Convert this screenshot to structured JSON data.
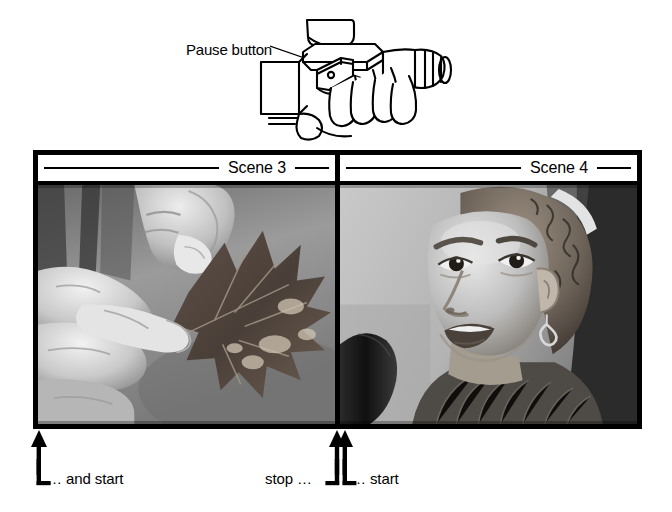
{
  "figure": {
    "illustration": {
      "callout_label": "Pause button",
      "subject_icon": "camcorder-in-hand-icon",
      "leader_line_icon": "leader-line-icon"
    },
    "scenes": [
      {
        "id": "scene-3",
        "title": "Scene 3",
        "photo_icon": "hands-holding-leaf-photo",
        "photo_description": "Black and white photo of two hands holding a dried maple leaf"
      },
      {
        "id": "scene-4",
        "title": "Scene 4",
        "photo_icon": "girl-speaking-into-microphone-photo",
        "photo_description": "Black and white photo of a young girl speaking into a microphone"
      }
    ],
    "markers": [
      {
        "id": "marker-and-start",
        "caption": "… and start",
        "bracket": "L",
        "arrow_icon": "up-arrow-icon",
        "arrow_count": 1
      },
      {
        "id": "marker-stop",
        "caption": "stop …",
        "bracket": "J",
        "arrow_icon": "up-arrow-icon",
        "arrow_count": 1
      },
      {
        "id": "marker-start",
        "caption": "… start",
        "bracket": "L",
        "arrow_icon": "up-arrow-icon",
        "arrow_count": 1
      }
    ],
    "colors": {
      "ink": "#000000",
      "paper": "#ffffff",
      "photo_mid_gray": "#8d8d8d"
    }
  }
}
